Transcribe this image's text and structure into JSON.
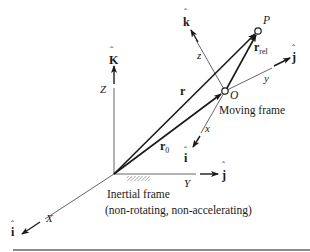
{
  "diagram": {
    "inertial_frame": {
      "label_line1": "Inertial frame",
      "label_line2": "(non-rotating, non-accelerating)",
      "axes": {
        "x": "X",
        "y": "Y",
        "z": "Z"
      },
      "unit_vectors": {
        "i": "i",
        "j": "j",
        "k": "K"
      }
    },
    "moving_frame": {
      "label": "Moving frame",
      "origin": "O",
      "axes": {
        "x": "x",
        "y": "y",
        "z": "z"
      },
      "unit_vectors": {
        "i": "i",
        "j": "j",
        "k": "k"
      }
    },
    "point": "P",
    "vectors": {
      "r": "r",
      "r0_base": "r",
      "r0_sub": "0",
      "rrel_base": "r",
      "rrel_sub": "rel"
    },
    "colors": {
      "ink": "#1a1a1a",
      "axis": "#555555",
      "hatch": "#888888"
    }
  }
}
